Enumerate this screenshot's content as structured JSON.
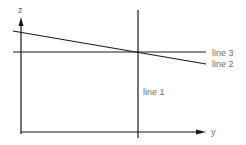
{
  "diagram": {
    "axes": {
      "vertical_label": "z",
      "horizontal_label": "y"
    },
    "lines": [
      {
        "id": "line1",
        "label": "line 1",
        "orientation": "vertical"
      },
      {
        "id": "line2",
        "label": "line 2",
        "orientation": "sloped-down"
      },
      {
        "id": "line3",
        "label": "line 3",
        "orientation": "horizontal"
      }
    ],
    "colors": {
      "stroke": "#1a1a1a",
      "label": "#6e6e6e",
      "background": "#ffffff"
    }
  }
}
